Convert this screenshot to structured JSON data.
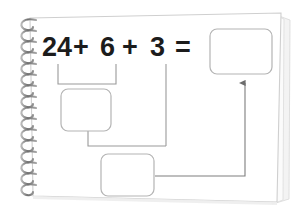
{
  "page": {
    "kind": "spiral-notebook-worksheet",
    "paper_color": "#ffffff",
    "paper_edge_color": "#cfcfcf",
    "paper_shadow_color": "#e4e4e4",
    "spiral_color": "#8f8f8f",
    "spiral_coil_count": 16
  },
  "worksheet": {
    "equation": {
      "full_text": "24 + 6 + 3 =",
      "tokens": [
        {
          "label": "24",
          "x": 42
        },
        {
          "label": "+",
          "x": 73
        },
        {
          "label": "6",
          "x": 100
        },
        {
          "label": "+",
          "x": 122
        },
        {
          "label": "3",
          "x": 150
        },
        {
          "label": "=",
          "x": 175
        }
      ],
      "baseline_y": 56
    },
    "answer_boxes": [
      {
        "id": "partial-sum-box",
        "name": "first-partial-sum-box",
        "value": "",
        "x": 61,
        "y": 89,
        "width": 50,
        "height": 42
      },
      {
        "id": "second-partial-sum-box",
        "name": "second-partial-sum-box",
        "value": "",
        "x": 101,
        "y": 154,
        "width": 53,
        "height": 42
      },
      {
        "id": "final-answer-box",
        "name": "final-answer-box",
        "value": "",
        "x": 210,
        "y": 29,
        "width": 62,
        "height": 45
      }
    ],
    "connectors": [
      {
        "name": "bracket-24-plus-6",
        "description": "bracket grouping 24 and 6 feeding the first partial sum box"
      },
      {
        "name": "partial-sum-to-second-box-elbow",
        "description": "elbow joining first partial sum and the 3 into the second box"
      },
      {
        "name": "term-3-drop-line",
        "description": "vertical drop line from the 3 term"
      },
      {
        "name": "second-box-to-final-answer-arrow",
        "description": "elbow arrow from second box up into the final answer box"
      }
    ],
    "line_color": "#9a9a9a",
    "box_border_color": "#b4b4b4"
  }
}
